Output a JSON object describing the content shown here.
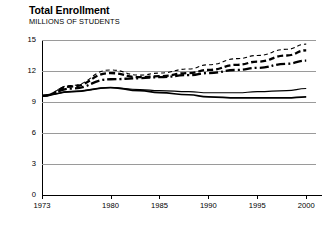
{
  "header": {
    "title": "Total Enrollment",
    "subtitle": "MILLIONS OF STUDENTS"
  },
  "chart_data": {
    "type": "line",
    "title": "Total Enrollment",
    "subtitle": "MILLIONS OF STUDENTS",
    "xlabel": "",
    "ylabel": "MILLIONS OF STUDENTS",
    "xlim": [
      1973,
      2001
    ],
    "ylim": [
      0,
      15
    ],
    "yticks": [
      0,
      3,
      6,
      9,
      12,
      15
    ],
    "ytick_labels": [
      "0",
      "3",
      "6",
      "9",
      "12",
      "15"
    ],
    "xticks": [
      1973,
      1980,
      1985,
      1990,
      1995,
      2000
    ],
    "xtick_labels": [
      "1973",
      "1980",
      "1985",
      "1990",
      "1995",
      "2000"
    ],
    "grid": "horizontal",
    "legend": "none",
    "x": [
      1973,
      1976,
      1980,
      1983,
      1985,
      1988,
      1990,
      1993,
      1995,
      1998,
      2000
    ],
    "series": [
      {
        "name": "projection-high",
        "style": "thin-dashed",
        "color": "#000000",
        "width": 1.1,
        "dash": "4,3",
        "values": [
          9.6,
          10.6,
          12.1,
          11.6,
          11.8,
          12.2,
          12.6,
          13.2,
          13.5,
          14.1,
          14.6
        ]
      },
      {
        "name": "projection-middle",
        "style": "thick-dashed",
        "color": "#000000",
        "width": 2.3,
        "dash": "6,3",
        "values": [
          9.6,
          10.5,
          11.8,
          11.4,
          11.5,
          11.8,
          12.1,
          12.6,
          12.9,
          13.5,
          14.0
        ]
      },
      {
        "name": "projection-low",
        "style": "dash-dot",
        "color": "#000000",
        "width": 2.3,
        "dash": "9,3,2,3",
        "values": [
          9.6,
          10.3,
          11.2,
          11.3,
          11.4,
          11.6,
          11.8,
          12.1,
          12.3,
          12.7,
          13.0
        ]
      },
      {
        "name": "enrollment-upper",
        "style": "thin-solid",
        "color": "#000000",
        "width": 1.1,
        "dash": "none",
        "values": [
          9.6,
          10.0,
          10.4,
          10.2,
          10.1,
          10.0,
          9.9,
          9.9,
          10.0,
          10.1,
          10.3
        ]
      },
      {
        "name": "enrollment-lower",
        "style": "thick-solid",
        "color": "#000000",
        "width": 1.7,
        "dash": "none",
        "values": [
          9.6,
          10.0,
          10.4,
          10.1,
          9.9,
          9.7,
          9.5,
          9.4,
          9.4,
          9.4,
          9.5
        ]
      }
    ]
  }
}
